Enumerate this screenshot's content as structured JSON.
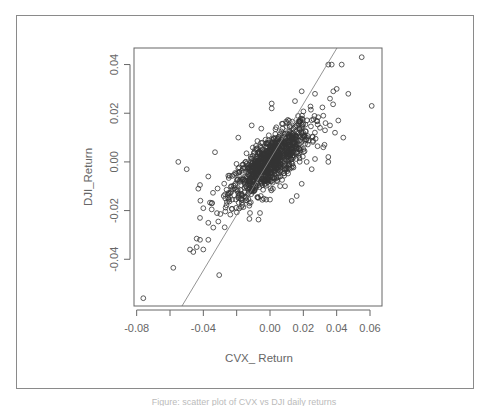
{
  "chart_data": {
    "type": "scatter",
    "title": "",
    "xlabel": "CVX_ Return",
    "ylabel": "DJI_Return",
    "xlim": [
      -0.0816,
      0.0672
    ],
    "ylim": [
      -0.0592,
      0.0468
    ],
    "x_ticks": [
      -0.08,
      -0.06,
      -0.04,
      -0.02,
      0.0,
      0.02,
      0.04,
      0.06
    ],
    "x_tick_labels": [
      "-0.08",
      "",
      "-0.04",
      "",
      "0.00",
      "0.02",
      "0.04",
      "0.06"
    ],
    "y_ticks": [
      0.04,
      0.02,
      0.0,
      -0.02,
      -0.04
    ],
    "y_tick_labels": [
      "0.04",
      "0.02",
      "0.00",
      "-0.02",
      "-0.04"
    ],
    "grid": false,
    "legend": null,
    "marker": "open-circle",
    "marker_color": "#333333",
    "regression_line": {
      "slope": 1.14,
      "intercept": 0.001,
      "color": "#888888"
    },
    "outliers": [
      {
        "x": -0.076,
        "y": -0.056
      },
      {
        "x": -0.058,
        "y": -0.0435
      },
      {
        "x": -0.055,
        "y": 0.0
      },
      {
        "x": -0.05,
        "y": -0.003
      },
      {
        "x": -0.0305,
        "y": -0.0465
      },
      {
        "x": 0.055,
        "y": 0.043
      },
      {
        "x": 0.061,
        "y": 0.023
      },
      {
        "x": 0.047,
        "y": 0.028
      },
      {
        "x": 0.044,
        "y": 0.01
      },
      {
        "x": 0.043,
        "y": 0.04
      },
      {
        "x": 0.035,
        "y": 0.04
      },
      {
        "x": 0.037,
        "y": 0.04
      },
      {
        "x": 0.025,
        "y": -0.003
      },
      {
        "x": 0.035,
        "y": 0.0
      },
      {
        "x": 0.035,
        "y": 0.002
      },
      {
        "x": 0.032,
        "y": 0.006
      },
      {
        "x": 0.041,
        "y": 0.017
      },
      {
        "x": 0.038,
        "y": 0.029
      },
      {
        "x": 0.04,
        "y": 0.03
      },
      {
        "x": 0.036,
        "y": 0.026
      },
      {
        "x": 0.027,
        "y": 0.028
      },
      {
        "x": 0.019,
        "y": 0.029
      },
      {
        "x": 0.015,
        "y": 0.025
      },
      {
        "x": 0.001,
        "y": 0.024
      },
      {
        "x": 0.001,
        "y": 0.022
      },
      {
        "x": -0.011,
        "y": 0.015
      },
      {
        "x": -0.019,
        "y": 0.01
      },
      {
        "x": -0.033,
        "y": 0.004
      },
      {
        "x": -0.037,
        "y": -0.006
      },
      {
        "x": -0.042,
        "y": -0.0095
      },
      {
        "x": -0.043,
        "y": -0.011
      },
      {
        "x": -0.04,
        "y": -0.019
      },
      {
        "x": -0.042,
        "y": -0.023
      },
      {
        "x": -0.037,
        "y": -0.025
      },
      {
        "x": -0.044,
        "y": -0.0315
      },
      {
        "x": -0.042,
        "y": -0.032
      },
      {
        "x": -0.037,
        "y": -0.032
      },
      {
        "x": -0.048,
        "y": -0.036
      },
      {
        "x": -0.046,
        "y": -0.037
      },
      {
        "x": -0.04,
        "y": -0.036
      },
      {
        "x": -0.044,
        "y": -0.035
      },
      {
        "x": -0.034,
        "y": -0.027
      },
      {
        "x": -0.031,
        "y": -0.0245
      },
      {
        "x": -0.035,
        "y": -0.0195
      },
      {
        "x": -0.012,
        "y": -0.021
      },
      {
        "x": -0.006,
        "y": -0.021
      },
      {
        "x": 0.013,
        "y": -0.016
      },
      {
        "x": 0.016,
        "y": -0.014
      },
      {
        "x": 0.019,
        "y": -0.009
      },
      {
        "x": 0.009,
        "y": -0.01
      },
      {
        "x": 0.0,
        "y": -0.0155
      },
      {
        "x": 0.022,
        "y": 0.0
      },
      {
        "x": 0.03,
        "y": 0.014
      },
      {
        "x": 0.032,
        "y": 0.019
      },
      {
        "x": 0.036,
        "y": 0.015
      },
      {
        "x": 0.039,
        "y": 0.012
      },
      {
        "x": 0.033,
        "y": 0.013
      }
    ],
    "cluster": {
      "description": "dense elliptical cloud of ~1000 daily returns centered near (0.00, 0.00) elongated along regression line",
      "center": [
        0.0,
        0.0
      ],
      "x_spread": 0.012,
      "y_spread": 0.008,
      "correlation": 0.78,
      "n_points": 1000
    }
  },
  "caption": "Figure: scatter plot of CVX vs DJI daily returns"
}
